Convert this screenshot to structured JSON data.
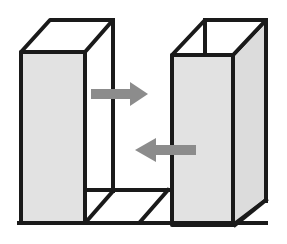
{
  "figure": {
    "type": "line-diagram",
    "canvas": {
      "width": 287,
      "height": 244,
      "background": "#ffffff"
    },
    "style": {
      "stroke_color": "#1a1a1a",
      "stroke_width": 4,
      "panel_fill": "#e2e2e2",
      "floor_fill": "#ffffff",
      "arrow_color": "#8c8c8c",
      "shaded_side_fill": "#dcdcdc"
    },
    "shapes": {
      "left_slab": {
        "label": "left slab wall",
        "front_face": "21,52 85,52 85,223 21,223",
        "top_bevel": "21,52 50,20 113,20 85,52",
        "back_edge": "113,20 113,190"
      },
      "right_slab": {
        "label": "right slab wall",
        "front_face": "172,55 233,55 233,225 172,225",
        "top_bevel": "205,20 266,20 233,55 172,55",
        "side_face": "233,55 266,20 266,200 233,225"
      },
      "floor": {
        "label": "floor plane between slabs",
        "outline": "21,223 266,223 266,200 233,225",
        "back_line": "85,190 233,190",
        "diagonals": [
          "86,222 113,190",
          "140,222 168,190"
        ]
      },
      "enclosure": {
        "label": "outer box edges",
        "bottom_edge": "21,223 266,223",
        "right_back_edge": "266,20 266,200"
      }
    },
    "arrows": [
      {
        "name": "arrow-right",
        "direction": "right",
        "label": "",
        "tail_x": 91,
        "tip_x": 148,
        "y": 94,
        "color": "#8c8c8c"
      },
      {
        "name": "arrow-left",
        "direction": "left",
        "label": "",
        "tail_x": 196,
        "tip_x": 135,
        "y": 150,
        "color": "#8c8c8c"
      }
    ]
  }
}
